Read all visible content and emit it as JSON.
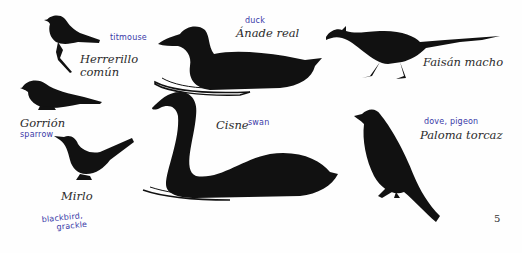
{
  "page": {
    "page_number": "5",
    "birds": [
      {
        "id": "herrerillo",
        "name": "Herrerillo común",
        "name_lines": [
          "Herrerillo",
          "común"
        ],
        "handwritten": "titmouse",
        "icon": "titmouse-silhouette-icon"
      },
      {
        "id": "anade",
        "name": "Ánade real",
        "handwritten": "duck",
        "icon": "duck-silhouette-icon"
      },
      {
        "id": "faisan",
        "name": "Faisán macho",
        "handwritten": "",
        "icon": "pheasant-silhouette-icon"
      },
      {
        "id": "gorrion",
        "name": "Gorrión",
        "handwritten": "sparrow",
        "icon": "sparrow-silhouette-icon"
      },
      {
        "id": "cisne",
        "name": "Cisne",
        "handwritten": "swan",
        "icon": "swan-silhouette-icon"
      },
      {
        "id": "mirlo",
        "name": "Mirlo",
        "handwritten_lines": [
          "blackbird,",
          "grackle"
        ],
        "icon": "blackbird-silhouette-icon"
      },
      {
        "id": "paloma",
        "name": "Paloma torcaz",
        "handwritten": "dove, pigeon",
        "icon": "pigeon-silhouette-icon"
      }
    ]
  },
  "colors": {
    "silhouette": "#111111",
    "label_text": "#2b2b2b",
    "handwriting": "#3a3aa8",
    "background": "#fefefe"
  }
}
